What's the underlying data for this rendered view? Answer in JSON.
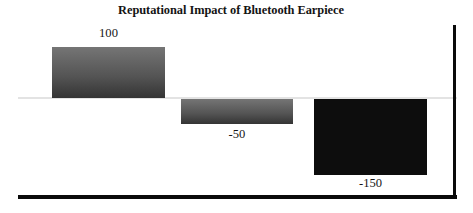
{
  "chart_data": {
    "type": "bar",
    "title": "Reputational Impact of Bluetooth Earpiece",
    "xlabel": "",
    "ylabel": "",
    "categories": [
      "",
      "",
      ""
    ],
    "values": [
      100,
      -50,
      -150
    ],
    "data_labels": [
      "100",
      "-50",
      "-150"
    ],
    "ylim": [
      -180,
      120
    ],
    "grid": false,
    "legend": "none",
    "zero_line": true,
    "series": [
      {
        "name": "Reputational Impact",
        "values": [
          100,
          -50,
          -150
        ]
      }
    ],
    "bar_styles": [
      {
        "fill": "gradient",
        "color_top": "#757575",
        "color_bottom": "#343434"
      },
      {
        "fill": "gradient",
        "color_top": "#757575",
        "color_bottom": "#343434"
      },
      {
        "fill": "solid",
        "color_top": "#0d0d0d",
        "color_bottom": "#0d0d0d"
      }
    ],
    "colors": {
      "zero_axis": "#e3e3e3",
      "frame_rule": "#0a0a0a",
      "title": "#141414",
      "label": "#161616",
      "background": "#ffffff"
    }
  }
}
